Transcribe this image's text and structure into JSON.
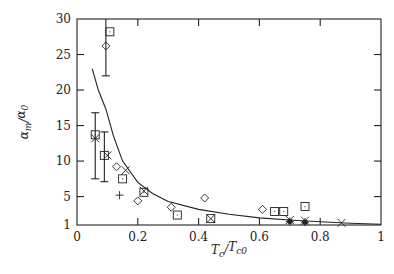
{
  "chart_data": {
    "type": "scatter",
    "title": "",
    "xlabel": "T_c/T_c0",
    "ylabel": "α_m/α_0",
    "xlim": [
      0,
      1
    ],
    "ylim": [
      1,
      30
    ],
    "grid": false,
    "legend": null,
    "x_ticks": [
      0,
      0.2,
      0.4,
      0.6,
      0.8,
      1
    ],
    "x_tick_labels": [
      "0",
      "0.2",
      "0.4",
      "0.6",
      "0.8",
      "1"
    ],
    "y_ticks": [
      1,
      5,
      10,
      15,
      20,
      25,
      30
    ],
    "y_tick_labels": [
      "1",
      "5",
      "10",
      "15",
      "20",
      "25",
      "30"
    ],
    "series": [
      {
        "name": "square",
        "marker": "square",
        "points": [
          [
            0.108,
            28.2
          ],
          [
            0.06,
            13.7
          ],
          [
            0.09,
            10.8
          ],
          [
            0.15,
            7.5
          ],
          [
            0.22,
            5.6
          ],
          [
            0.33,
            2.4
          ],
          [
            0.44,
            1.9
          ],
          [
            0.65,
            2.9
          ],
          [
            0.68,
            2.9
          ],
          [
            0.75,
            3.6
          ]
        ]
      },
      {
        "name": "diamond",
        "marker": "diamond",
        "points": [
          [
            0.095,
            26.2
          ],
          [
            0.13,
            9.2
          ],
          [
            0.2,
            4.4
          ],
          [
            0.31,
            3.5
          ],
          [
            0.42,
            4.8
          ],
          [
            0.61,
            3.2
          ]
        ]
      },
      {
        "name": "cross",
        "marker": "x",
        "points": [
          [
            0.06,
            13.2
          ],
          [
            0.1,
            10.8
          ],
          [
            0.16,
            8.7
          ],
          [
            0.22,
            5.8
          ],
          [
            0.44,
            1.9
          ],
          [
            0.7,
            1.7
          ],
          [
            0.75,
            1.6
          ],
          [
            0.87,
            1.3
          ]
        ]
      },
      {
        "name": "plus",
        "marker": "plus",
        "points": [
          [
            0.14,
            5.2
          ],
          [
            0.7,
            1.5
          ],
          [
            0.75,
            1.4
          ]
        ]
      },
      {
        "name": "filled",
        "marker": "filled-circle",
        "points": [
          [
            0.7,
            1.5
          ],
          [
            0.75,
            1.4
          ]
        ]
      }
    ],
    "error_bars": [
      {
        "x": 0.095,
        "y_low": 22,
        "y_high": 30
      },
      {
        "x": 0.06,
        "y_low": 7.5,
        "y_high": 16.8
      },
      {
        "x": 0.09,
        "y_low": 7.1,
        "y_high": 14.1
      }
    ],
    "fit_curve": {
      "description": "decaying fit curve",
      "points": [
        [
          0.05,
          23
        ],
        [
          0.07,
          20
        ],
        [
          0.095,
          17.3
        ],
        [
          0.12,
          13.5
        ],
        [
          0.15,
          10
        ],
        [
          0.2,
          7
        ],
        [
          0.25,
          5.4
        ],
        [
          0.3,
          4.3
        ],
        [
          0.4,
          3.2
        ],
        [
          0.5,
          2.5
        ],
        [
          0.6,
          2.0
        ],
        [
          0.7,
          1.7
        ],
        [
          0.8,
          1.45
        ],
        [
          0.9,
          1.25
        ],
        [
          1.0,
          1.1
        ]
      ]
    }
  }
}
